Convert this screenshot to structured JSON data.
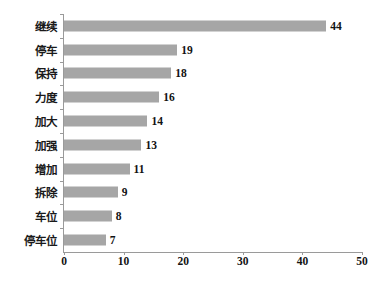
{
  "chart_data": {
    "type": "bar",
    "orientation": "horizontal",
    "title": "",
    "subtitle": "",
    "xlabel": "",
    "ylabel": "",
    "categories": [
      "继续",
      "停车",
      "保持",
      "力度",
      "加大",
      "加强",
      "增加",
      "拆除",
      "车位",
      "停车位"
    ],
    "values": [
      44,
      19,
      18,
      16,
      14,
      13,
      11,
      9,
      8,
      7
    ],
    "data_labels": [
      "44",
      "19",
      "18",
      "16",
      "14",
      "13",
      "11",
      "9",
      "8",
      "7"
    ],
    "xlim": [
      0,
      50
    ],
    "xticks": [
      0,
      10,
      20,
      30,
      40,
      50
    ],
    "xtick_labels": [
      "0",
      "10",
      "20",
      "30",
      "40",
      "50"
    ],
    "grid": false,
    "legend": null,
    "legend_position": "none",
    "bar_color": "#a6a6a6",
    "axis_color": "#9a9a9a",
    "text_color": "#121212",
    "background": "#ffffff"
  }
}
